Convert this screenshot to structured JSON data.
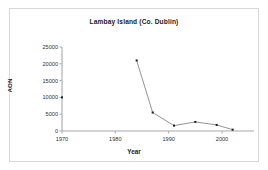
{
  "figure": {
    "border_color": "#d8d8d8",
    "background": "#ffffff"
  },
  "chart_data": {
    "type": "line",
    "title": "Lambay Island (Co. Dublin)",
    "xlabel": "Year",
    "ylabel": "AON",
    "xlim": [
      1968,
      2006
    ],
    "ylim": [
      0,
      25000
    ],
    "xticks": [
      1970,
      1980,
      1990,
      2000
    ],
    "xtick_labels": [
      "1970",
      "1980",
      "1990",
      "2000"
    ],
    "yticks": [
      0,
      5000,
      10000,
      15000,
      20000,
      25000
    ],
    "ytick_labels": [
      "0",
      "5000",
      "10000",
      "15000",
      "20000",
      "25000"
    ],
    "grid": false,
    "legend": null,
    "marker": "square",
    "marker_color": "#1a1a1a",
    "line_color": "#888888",
    "axis_color": "#aaaaaa",
    "series": [
      {
        "name": "AON",
        "x": [
          1970,
          1984,
          1987,
          1991,
          1995,
          1999,
          2002
        ],
        "y": [
          10000,
          21000,
          5500,
          1600,
          2700,
          1800,
          400
        ],
        "connected_from_index": 1
      }
    ]
  }
}
